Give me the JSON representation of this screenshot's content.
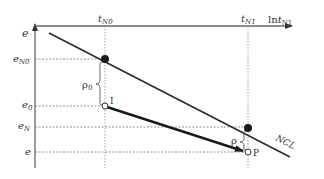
{
  "diagram": {
    "type": "e vs ln t consolidation diagram",
    "colors": {
      "axis": "#555555",
      "ncl_line": "#2a2a2a",
      "path_line": "#1a1a1a",
      "dashed": "#777777",
      "point_fill": "#1a1a1a",
      "open_point_fill": "#ffffff"
    },
    "axes": {
      "y_label": "e",
      "x_label_prefix": "ln",
      "x_label_var": "t",
      "x_label_sub": "N1"
    },
    "x_ticks": [
      {
        "var": "t",
        "sub": "N0"
      },
      {
        "var": "t",
        "sub": "N1"
      }
    ],
    "y_ticks": [
      {
        "var": "e",
        "sub": "N0"
      },
      {
        "var": "e",
        "sub": "0"
      },
      {
        "var": "e",
        "sub": "N"
      },
      {
        "var": "e",
        "sub": ""
      }
    ],
    "line_label": "NCL",
    "points": [
      {
        "label": "I"
      },
      {
        "label": "P"
      }
    ],
    "gaps": [
      {
        "symbol": "ρ",
        "sub": "0"
      },
      {
        "symbol": "ρ",
        "sub": ""
      }
    ]
  }
}
